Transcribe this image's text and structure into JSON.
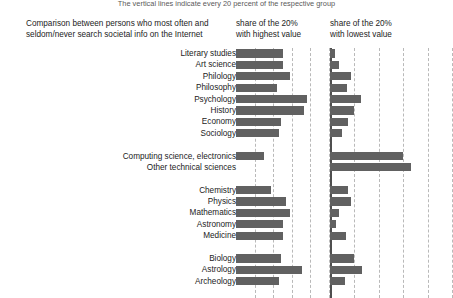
{
  "note": "The vertical lines indicate every 20 percent of the respective group",
  "header": {
    "left_line1": "Comparison between persons who most often and",
    "left_line2": "seldom/never search societal info on the Internet",
    "mid_line1": "share of the 20%",
    "mid_line2": "with highest value",
    "right_line1": "share of the 20%",
    "right_line2": "with lowest value"
  },
  "chart_data": {
    "type": "bar",
    "title": "Comparison between persons who most often and seldom/never search societal info on the Internet",
    "subtitle": "The vertical lines indicate every 20 percent of the respective group",
    "orientation": "horizontal",
    "xlabel": "",
    "ylabel": "",
    "xlim": [
      0,
      100
    ],
    "xunit": "percent",
    "gridlines": [
      20,
      40,
      60,
      80,
      100
    ],
    "grid": true,
    "legend": "none",
    "bar_color": "#616161",
    "grid_color": "#b9b9b9",
    "categories": [
      "Literary studies",
      "Art science",
      "Philology",
      "Philosophy",
      "Psychology",
      "History",
      "Economy",
      "Sociology",
      "",
      "Computing science, electronics",
      "Other technical sciences",
      "",
      "Chemistry",
      "Physics",
      "Mathematics",
      "Astronomy",
      "Medicine",
      "",
      "Biology",
      "Astrology",
      "Archeology"
    ],
    "series": [
      {
        "name": "share of the 20% with highest value",
        "panel": "left",
        "values": [
          51,
          50,
          58,
          44,
          76,
          73,
          48,
          46,
          null,
          30,
          0,
          null,
          38,
          54,
          58,
          51,
          51,
          null,
          48,
          71,
          46
        ]
      },
      {
        "name": "share of the 20% with lowest value",
        "panel": "right",
        "values": [
          4,
          7,
          17,
          14,
          25,
          20,
          15,
          10,
          null,
          60,
          66,
          null,
          15,
          17,
          7,
          5,
          13,
          null,
          20,
          26,
          12
        ]
      }
    ]
  }
}
